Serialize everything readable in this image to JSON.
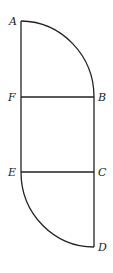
{
  "diagram": {
    "title": "",
    "points": {
      "A": {
        "label": "A",
        "x": 21,
        "y": 21
      },
      "B": {
        "label": "B",
        "x": 94,
        "y": 97
      },
      "C": {
        "label": "C",
        "x": 94,
        "y": 172
      },
      "D": {
        "label": "D",
        "x": 94,
        "y": 247
      },
      "E": {
        "label": "E",
        "x": 21,
        "y": 172
      },
      "F": {
        "label": "F",
        "x": 21,
        "y": 97
      }
    },
    "segments": [
      {
        "from": "A",
        "to": "F"
      },
      {
        "from": "F",
        "to": "E"
      },
      {
        "from": "F",
        "to": "B"
      },
      {
        "from": "B",
        "to": "C"
      },
      {
        "from": "E",
        "to": "C"
      },
      {
        "from": "C",
        "to": "D"
      }
    ],
    "arcs": [
      {
        "from": "A",
        "to": "B",
        "center": "F",
        "type": "quarter-circle"
      },
      {
        "from": "E",
        "to": "D",
        "center": "C",
        "type": "quarter-circle"
      }
    ],
    "stroke_color": "#222222",
    "background": "#ffffff"
  }
}
